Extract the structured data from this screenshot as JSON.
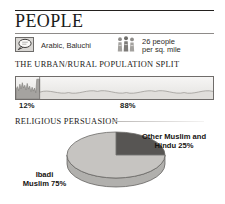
{
  "page": {
    "title": "PEOPLE"
  },
  "facts": {
    "language": {
      "icon": "speech-balloon-icon",
      "text": "Arabic, Baluchi"
    },
    "density": {
      "icon": "population-density-icon",
      "line1": "26 people",
      "line2": "per sq. mile"
    }
  },
  "urban_rural": {
    "heading": "THE URBAN/RURAL POPULATION SPLIT",
    "urban_pct_label": "12%",
    "rural_pct_label": "88%"
  },
  "religion": {
    "heading": "RELIGIOUS PERSUASION",
    "right_label_line1": "Other Muslim and",
    "right_label_line2": "Hindu 25%",
    "left_label_line1": "Ibadi",
    "left_label_line2": "Muslim 75%"
  },
  "colors": {
    "rule": "#23201e",
    "rule_sub": "#8e8b89",
    "panel_border": "#6f6c6a",
    "skyline": "#a5a3a0",
    "terrain": "#e0dedb",
    "terrain_line": "#9b9895",
    "pie_light": "#c6c4c1",
    "pie_dark": "#575553",
    "pie_outline": "#6b6967",
    "text": "#1b1b1b"
  },
  "chart_data": [
    {
      "type": "bar",
      "title": "THE URBAN/RURAL POPULATION SPLIT",
      "categories": [
        "Urban",
        "Rural"
      ],
      "values": [
        12,
        88
      ],
      "value_labels": [
        "12%",
        "88%"
      ],
      "ylabel": "percent of total population",
      "xlabel": "",
      "ylim": [
        0,
        100
      ],
      "grid": false,
      "legend": "none",
      "note": "Single stacked horizontal band; left 12% drawn as city skyline, right 88% drawn as rural terrain."
    },
    {
      "type": "pie",
      "title": "RELIGIOUS PERSUASION",
      "labels": [
        "Ibadi Muslim",
        "Other Muslim and Hindu"
      ],
      "values": [
        75,
        25
      ],
      "ylim": [
        0,
        100
      ],
      "legend": "labels placed beside slices",
      "slices": [
        {
          "name": "Other Muslim and Hindu",
          "value": 25,
          "color": "#575553"
        },
        {
          "name": "Ibadi Muslim",
          "value": 75,
          "color": "#c6c4c1"
        }
      ],
      "start_angle_deg": 0,
      "direction": "clockwise",
      "note": "3-D style pie, start at 12 o'clock, dark 25% wedge occupies top-right quadrant."
    }
  ]
}
